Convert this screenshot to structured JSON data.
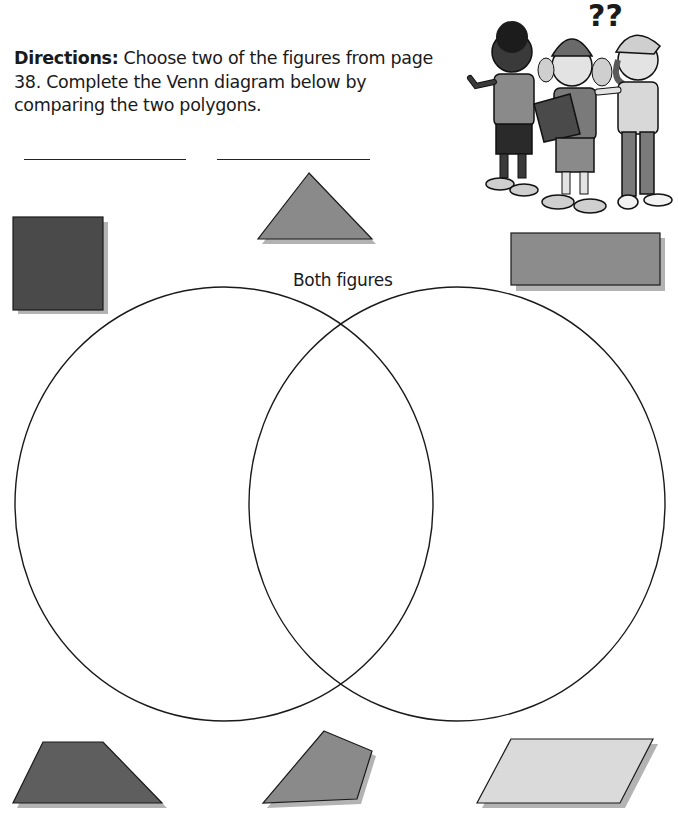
{
  "directions": {
    "label": "Directions:",
    "text": " Choose two of the figures from page 38. Complete the Venn diagram below by comparing the two polygons."
  },
  "answer_blanks": [
    {
      "id": "figure-1-name",
      "value": ""
    },
    {
      "id": "figure-2-name",
      "value": ""
    }
  ],
  "venn": {
    "center_label": "Both figures",
    "left_circle": {
      "cx": 224,
      "cy": 504,
      "rx": 209,
      "ry": 217
    },
    "right_circle": {
      "cx": 457,
      "cy": 504,
      "rx": 208,
      "ry": 217
    }
  },
  "illustration": {
    "description": "Three cartoon kids, one holding a clipboard, with question marks",
    "question_marks": "??"
  },
  "figures": [
    {
      "name": "square",
      "fill": "#4a4a4a"
    },
    {
      "name": "triangle",
      "fill": "#8a8a8a"
    },
    {
      "name": "rectangle",
      "fill": "#8c8c8c"
    },
    {
      "name": "trapezoid",
      "fill": "#5e5e5e"
    },
    {
      "name": "quadrilateral",
      "fill": "#8a8a8a"
    },
    {
      "name": "parallelogram",
      "fill": "#dadada"
    }
  ],
  "colors": {
    "shadow": "#b3b3b3",
    "outline": "#1a1a1a"
  }
}
